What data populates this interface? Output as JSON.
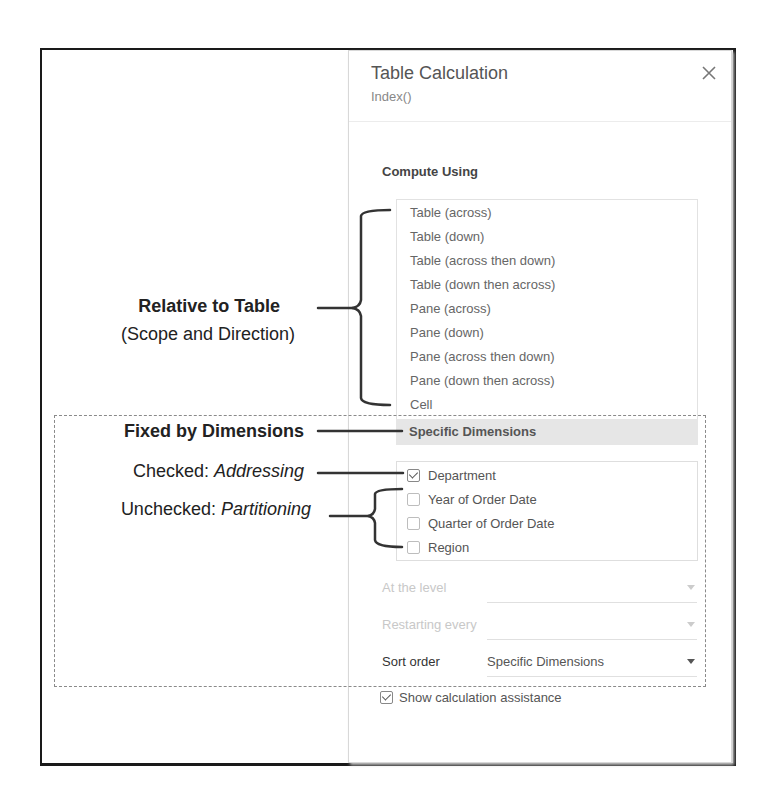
{
  "dialog": {
    "title": "Table Calculation",
    "subtitle": "Index()",
    "close_icon": "close-icon",
    "compute_using_label": "Compute Using",
    "compute_options": [
      "Table (across)",
      "Table (down)",
      "Table (across then down)",
      "Table (down then across)",
      "Pane (across)",
      "Pane (down)",
      "Pane (across then down)",
      "Pane (down then across)",
      "Cell"
    ],
    "selected_option": "Specific Dimensions",
    "dimensions": [
      {
        "label": "Department",
        "checked": true
      },
      {
        "label": "Year of Order Date",
        "checked": false
      },
      {
        "label": "Quarter of Order Date",
        "checked": false
      },
      {
        "label": "Region",
        "checked": false
      }
    ],
    "at_the_level": {
      "label": "At the level",
      "value": "",
      "disabled": true
    },
    "restarting_every": {
      "label": "Restarting every",
      "value": "",
      "disabled": true
    },
    "sort_order": {
      "label": "Sort order",
      "value": "Specific Dimensions",
      "disabled": false
    },
    "show_assistance": {
      "label": "Show calculation assistance",
      "checked": true
    }
  },
  "annotations": {
    "relative_title": "Relative to Table",
    "relative_sub": "(Scope and Direction)",
    "fixed_title": "Fixed by Dimensions",
    "checked_prefix": "Checked: ",
    "checked_term": "Addressing",
    "unchecked_prefix": "Unchecked: ",
    "unchecked_term": "Partitioning"
  }
}
